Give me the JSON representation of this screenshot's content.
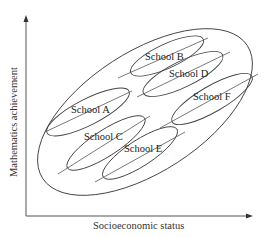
{
  "diagram": {
    "x_axis_label": "Socioeconomic status",
    "y_axis_label": "Mathematics achievement",
    "schools": [
      {
        "id": "A",
        "label": "School A"
      },
      {
        "id": "B",
        "label": "School B"
      },
      {
        "id": "C",
        "label": "School C"
      },
      {
        "id": "D",
        "label": "School D"
      },
      {
        "id": "E",
        "label": "School E"
      },
      {
        "id": "F",
        "label": "School F"
      }
    ],
    "colors": {
      "stroke": "#444444",
      "text": "#222222",
      "background": "#ffffff"
    }
  }
}
